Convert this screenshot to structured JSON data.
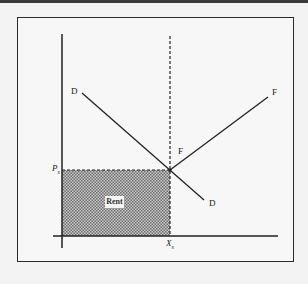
{
  "diagram": {
    "type": "economic-rent-diagram",
    "labels": {
      "demand_top": "D",
      "demand_bottom": "D",
      "factor_top": "F",
      "factor_mid": "F",
      "price_axis": "P",
      "price_sub": "s",
      "quantity_axis": "X",
      "quantity_sub": "s",
      "rent_area": "Rent"
    },
    "colors": {
      "lines": "#222222",
      "frame": "#2a2a2a",
      "shading": "#9a9a9a",
      "background": "#f7f7f7"
    }
  }
}
